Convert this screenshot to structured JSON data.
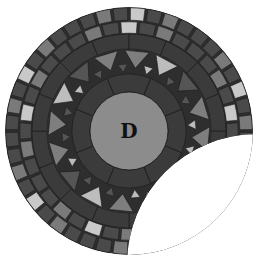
{
  "diagram": {
    "center_label": "D",
    "geometry": {
      "cx": 129,
      "cy": 131,
      "center_r": 39,
      "inner_band_r": 57,
      "triangle_ring_r": 82,
      "outer_band_r": 97,
      "tile_mid_r": 110,
      "outer_r": 124,
      "cutout": {
        "cx": 257,
        "cy": 264,
        "r": 130
      }
    },
    "colors": {
      "background": "#ffffff",
      "center": "#8c8c8c",
      "dark": "#3b3b3b",
      "darker": "#2e2e2e",
      "grout": "#1e1e1e",
      "tile_light": "#c9c9c9",
      "tile_mid": "#7a7a7a",
      "tile_dark": "#4a4a4a",
      "tri_light": "#bdbdbd",
      "tri_mid": "#7e7e7e",
      "tri_dark": "#555555",
      "text": "#111111"
    },
    "counts": {
      "inner_band_segments": 8,
      "outer_band_segments": 16,
      "big_triangles": 16,
      "outer_tiles": 44,
      "inner_tiles": 36
    }
  }
}
